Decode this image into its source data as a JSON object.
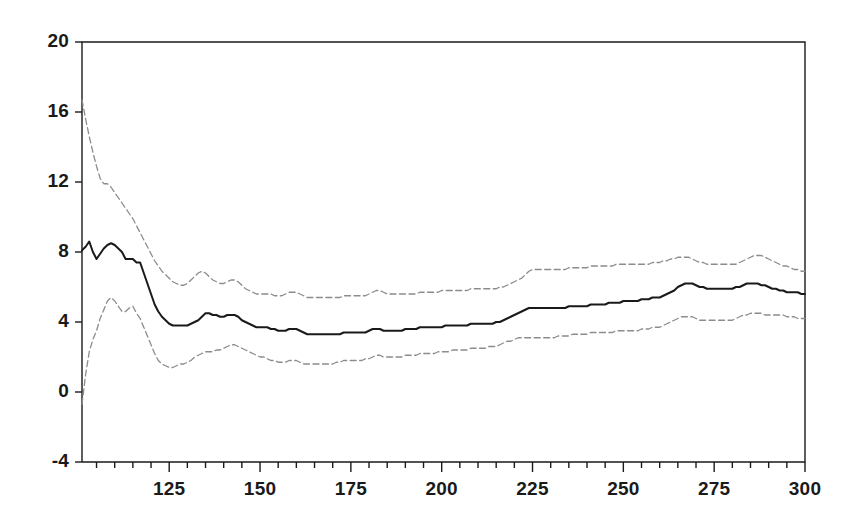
{
  "chart_data": {
    "type": "line",
    "title": "",
    "subtitle": "",
    "xlabel": "",
    "ylabel": "",
    "xlim": [
      101,
      300
    ],
    "ylim": [
      -4,
      20
    ],
    "grid": false,
    "legend_position": "none",
    "x_ticks": [
      125,
      150,
      175,
      200,
      225,
      250,
      275,
      300
    ],
    "x_tick_labels": [
      "125",
      "150",
      "175",
      "200",
      "225",
      "250",
      "275",
      "300"
    ],
    "x_minor_tick_step": 5,
    "y_ticks": [
      -4,
      0,
      4,
      8,
      12,
      16,
      20
    ],
    "y_tick_labels": [
      "-4",
      "0",
      "4",
      "8",
      "12",
      "16",
      "20"
    ],
    "annotations": [],
    "colors": {
      "axis": "#1a1a1a",
      "estimate_line": "#1a1a1a",
      "confidence_band": "#8c8c8c",
      "background": "#ffffff"
    },
    "styles": {
      "estimate_line": "solid",
      "upper_band": "dashed",
      "lower_band": "dashed"
    },
    "x": [
      101,
      102,
      103,
      104,
      105,
      106,
      107,
      108,
      109,
      110,
      111,
      112,
      113,
      114,
      115,
      116,
      117,
      118,
      119,
      120,
      121,
      122,
      123,
      124,
      125,
      126,
      127,
      128,
      129,
      130,
      131,
      132,
      133,
      134,
      135,
      136,
      137,
      138,
      139,
      140,
      141,
      142,
      143,
      144,
      145,
      146,
      147,
      148,
      149,
      150,
      151,
      152,
      153,
      154,
      155,
      156,
      157,
      158,
      159,
      160,
      161,
      162,
      163,
      164,
      165,
      166,
      167,
      168,
      169,
      170,
      171,
      172,
      173,
      174,
      175,
      176,
      177,
      178,
      179,
      180,
      181,
      182,
      183,
      184,
      185,
      186,
      187,
      188,
      189,
      190,
      191,
      192,
      193,
      194,
      195,
      196,
      197,
      198,
      199,
      200,
      201,
      202,
      203,
      204,
      205,
      206,
      207,
      208,
      209,
      210,
      211,
      212,
      213,
      214,
      215,
      216,
      217,
      218,
      219,
      220,
      221,
      222,
      223,
      224,
      225,
      226,
      227,
      228,
      229,
      230,
      231,
      232,
      233,
      234,
      235,
      236,
      237,
      238,
      239,
      240,
      241,
      242,
      243,
      244,
      245,
      246,
      247,
      248,
      249,
      250,
      251,
      252,
      253,
      254,
      255,
      256,
      257,
      258,
      259,
      260,
      261,
      262,
      263,
      264,
      265,
      266,
      267,
      268,
      269,
      270,
      271,
      272,
      273,
      274,
      275,
      276,
      277,
      278,
      279,
      280,
      281,
      282,
      283,
      284,
      285,
      286,
      287,
      288,
      289,
      290,
      291,
      292,
      293,
      294,
      295,
      296,
      297,
      298,
      299,
      300
    ],
    "series": [
      {
        "name": "upper confidence bound",
        "style": "dashed",
        "color": "#8c8c8c",
        "values": [
          16.7,
          15.6,
          14.6,
          13.7,
          12.9,
          12.2,
          11.9,
          11.9,
          11.7,
          11.4,
          11.1,
          10.8,
          10.5,
          10.2,
          9.9,
          9.5,
          9.1,
          8.7,
          8.3,
          7.9,
          7.5,
          7.2,
          6.9,
          6.7,
          6.5,
          6.3,
          6.2,
          6.1,
          6.1,
          6.2,
          6.4,
          6.6,
          6.8,
          6.9,
          6.8,
          6.6,
          6.4,
          6.3,
          6.2,
          6.2,
          6.3,
          6.4,
          6.4,
          6.3,
          6.1,
          5.9,
          5.8,
          5.7,
          5.6,
          5.6,
          5.6,
          5.6,
          5.6,
          5.5,
          5.5,
          5.5,
          5.6,
          5.7,
          5.7,
          5.7,
          5.6,
          5.5,
          5.4,
          5.4,
          5.4,
          5.4,
          5.4,
          5.4,
          5.4,
          5.4,
          5.4,
          5.4,
          5.5,
          5.5,
          5.5,
          5.5,
          5.5,
          5.5,
          5.5,
          5.6,
          5.7,
          5.8,
          5.8,
          5.7,
          5.6,
          5.6,
          5.6,
          5.6,
          5.6,
          5.6,
          5.6,
          5.6,
          5.6,
          5.7,
          5.7,
          5.7,
          5.7,
          5.7,
          5.7,
          5.8,
          5.8,
          5.8,
          5.8,
          5.8,
          5.8,
          5.8,
          5.8,
          5.9,
          5.9,
          5.9,
          5.9,
          5.9,
          5.9,
          5.9,
          5.9,
          6.0,
          6.0,
          6.1,
          6.2,
          6.3,
          6.4,
          6.5,
          6.7,
          6.9,
          7.0,
          7.0,
          7.0,
          7.0,
          7.0,
          7.0,
          7.0,
          7.0,
          7.0,
          7.0,
          7.1,
          7.1,
          7.1,
          7.1,
          7.1,
          7.1,
          7.2,
          7.2,
          7.2,
          7.2,
          7.2,
          7.2,
          7.2,
          7.3,
          7.3,
          7.3,
          7.3,
          7.3,
          7.3,
          7.3,
          7.3,
          7.3,
          7.3,
          7.4,
          7.4,
          7.4,
          7.5,
          7.5,
          7.6,
          7.6,
          7.7,
          7.7,
          7.7,
          7.7,
          7.6,
          7.5,
          7.4,
          7.4,
          7.3,
          7.3,
          7.3,
          7.3,
          7.3,
          7.3,
          7.3,
          7.3,
          7.3,
          7.4,
          7.5,
          7.6,
          7.7,
          7.8,
          7.8,
          7.8,
          7.7,
          7.6,
          7.5,
          7.4,
          7.3,
          7.2,
          7.2,
          7.1,
          7.0,
          7.0,
          6.9,
          6.9
        ]
      },
      {
        "name": "point estimate",
        "style": "solid",
        "color": "#1a1a1a",
        "values": [
          8.1,
          8.3,
          8.6,
          8.0,
          7.6,
          7.9,
          8.2,
          8.4,
          8.5,
          8.4,
          8.2,
          8.0,
          7.6,
          7.6,
          7.6,
          7.4,
          7.4,
          6.8,
          6.2,
          5.6,
          5.0,
          4.6,
          4.3,
          4.1,
          3.9,
          3.8,
          3.8,
          3.8,
          3.8,
          3.8,
          3.9,
          4.0,
          4.1,
          4.3,
          4.5,
          4.5,
          4.4,
          4.4,
          4.3,
          4.3,
          4.4,
          4.4,
          4.4,
          4.3,
          4.1,
          4.0,
          3.9,
          3.8,
          3.7,
          3.7,
          3.7,
          3.7,
          3.6,
          3.6,
          3.5,
          3.5,
          3.5,
          3.6,
          3.6,
          3.6,
          3.5,
          3.4,
          3.3,
          3.3,
          3.3,
          3.3,
          3.3,
          3.3,
          3.3,
          3.3,
          3.3,
          3.3,
          3.4,
          3.4,
          3.4,
          3.4,
          3.4,
          3.4,
          3.4,
          3.5,
          3.6,
          3.6,
          3.6,
          3.5,
          3.5,
          3.5,
          3.5,
          3.5,
          3.5,
          3.6,
          3.6,
          3.6,
          3.6,
          3.7,
          3.7,
          3.7,
          3.7,
          3.7,
          3.7,
          3.7,
          3.8,
          3.8,
          3.8,
          3.8,
          3.8,
          3.8,
          3.8,
          3.9,
          3.9,
          3.9,
          3.9,
          3.9,
          3.9,
          3.9,
          4.0,
          4.0,
          4.1,
          4.2,
          4.3,
          4.4,
          4.5,
          4.6,
          4.7,
          4.8,
          4.8,
          4.8,
          4.8,
          4.8,
          4.8,
          4.8,
          4.8,
          4.8,
          4.8,
          4.8,
          4.9,
          4.9,
          4.9,
          4.9,
          4.9,
          4.9,
          5.0,
          5.0,
          5.0,
          5.0,
          5.0,
          5.1,
          5.1,
          5.1,
          5.1,
          5.2,
          5.2,
          5.2,
          5.2,
          5.2,
          5.3,
          5.3,
          5.3,
          5.4,
          5.4,
          5.4,
          5.5,
          5.6,
          5.7,
          5.8,
          6.0,
          6.1,
          6.2,
          6.2,
          6.2,
          6.1,
          6.0,
          6.0,
          5.9,
          5.9,
          5.9,
          5.9,
          5.9,
          5.9,
          5.9,
          5.9,
          6.0,
          6.0,
          6.1,
          6.2,
          6.2,
          6.2,
          6.2,
          6.1,
          6.1,
          6.0,
          5.9,
          5.9,
          5.8,
          5.8,
          5.7,
          5.7,
          5.7,
          5.7,
          5.6,
          5.6
        ]
      },
      {
        "name": "lower confidence bound",
        "style": "dashed",
        "color": "#8c8c8c",
        "values": [
          -0.7,
          1.0,
          2.3,
          3.0,
          3.5,
          4.2,
          4.7,
          5.2,
          5.4,
          5.2,
          4.9,
          4.6,
          4.6,
          4.8,
          4.9,
          4.5,
          4.2,
          3.7,
          3.2,
          2.7,
          2.2,
          1.8,
          1.6,
          1.5,
          1.4,
          1.4,
          1.5,
          1.6,
          1.6,
          1.7,
          1.8,
          2.0,
          2.1,
          2.2,
          2.3,
          2.3,
          2.3,
          2.4,
          2.4,
          2.5,
          2.6,
          2.7,
          2.7,
          2.6,
          2.5,
          2.4,
          2.3,
          2.2,
          2.1,
          2.0,
          2.0,
          1.9,
          1.8,
          1.8,
          1.7,
          1.7,
          1.7,
          1.8,
          1.8,
          1.8,
          1.7,
          1.6,
          1.6,
          1.6,
          1.6,
          1.6,
          1.6,
          1.6,
          1.6,
          1.6,
          1.7,
          1.7,
          1.8,
          1.8,
          1.8,
          1.8,
          1.8,
          1.8,
          1.9,
          1.9,
          2.0,
          2.1,
          2.1,
          2.0,
          2.0,
          2.0,
          2.0,
          2.0,
          2.0,
          2.1,
          2.1,
          2.1,
          2.1,
          2.2,
          2.2,
          2.2,
          2.2,
          2.2,
          2.3,
          2.3,
          2.3,
          2.3,
          2.4,
          2.4,
          2.4,
          2.4,
          2.4,
          2.5,
          2.5,
          2.5,
          2.5,
          2.5,
          2.6,
          2.6,
          2.6,
          2.7,
          2.8,
          2.9,
          2.9,
          3.0,
          3.1,
          3.1,
          3.1,
          3.1,
          3.1,
          3.1,
          3.1,
          3.1,
          3.1,
          3.1,
          3.1,
          3.2,
          3.2,
          3.2,
          3.2,
          3.3,
          3.3,
          3.3,
          3.3,
          3.3,
          3.4,
          3.4,
          3.4,
          3.4,
          3.4,
          3.4,
          3.4,
          3.5,
          3.5,
          3.5,
          3.5,
          3.5,
          3.5,
          3.5,
          3.6,
          3.6,
          3.6,
          3.7,
          3.7,
          3.7,
          3.8,
          3.9,
          4.0,
          4.1,
          4.2,
          4.3,
          4.3,
          4.3,
          4.3,
          4.2,
          4.1,
          4.1,
          4.1,
          4.1,
          4.1,
          4.1,
          4.1,
          4.1,
          4.1,
          4.1,
          4.2,
          4.3,
          4.4,
          4.4,
          4.5,
          4.5,
          4.5,
          4.5,
          4.4,
          4.4,
          4.4,
          4.4,
          4.4,
          4.4,
          4.3,
          4.3,
          4.3,
          4.2,
          4.2,
          4.2
        ]
      }
    ]
  },
  "layout": {
    "plot_left": 82,
    "plot_right": 805,
    "plot_top": 42,
    "plot_bottom": 462
  }
}
